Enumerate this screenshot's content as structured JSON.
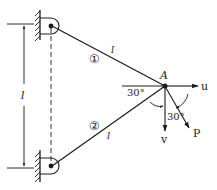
{
  "diagram": {
    "type": "two-bar truss with pinned supports and applied load",
    "members": [
      {
        "id": "1",
        "label": "①",
        "length_label": "l"
      },
      {
        "id": "2",
        "label": "②",
        "length_label": "l"
      }
    ],
    "node": {
      "label": "A"
    },
    "support_spacing_label": "l",
    "angles": {
      "member_angle": "30°",
      "load_angle": "30°"
    },
    "displacements": {
      "horizontal": "u",
      "vertical": "v"
    },
    "load": {
      "label": "P"
    },
    "colors": {
      "line": "#1a1a1a",
      "background": "#ffffff"
    }
  }
}
